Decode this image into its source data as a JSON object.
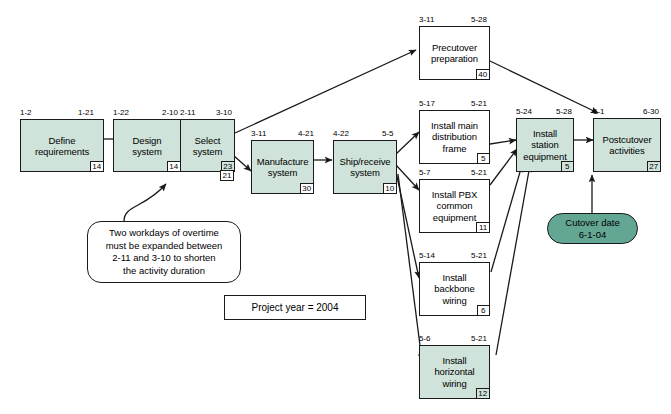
{
  "colors": {
    "critical_fill": "#cfe3da",
    "noncritical_fill": "#ffffff",
    "milestone_fill": "#63a694",
    "line": "#1a1a1a"
  },
  "legend": {
    "project_year_label": "Project year = 2004"
  },
  "note": {
    "text": "Two workdays of overtime\nmust be expanded between\n2-11 and 3-10 to shorten\nthe activity duration"
  },
  "milestone": {
    "name": "Cutover date",
    "date": "6-1-04",
    "text": "Cutover date\n6-1-04"
  },
  "nodes": [
    {
      "id": "define-requirements",
      "label": "Define\nrequirements",
      "start": "1-2",
      "finish": "1-21",
      "duration": "14",
      "critical": true
    },
    {
      "id": "design-system",
      "label": "Design\nsystem",
      "start": "1-22",
      "finish": "2-10",
      "duration": "14",
      "critical": true
    },
    {
      "id": "select-system",
      "label": "Select\nsystem",
      "start": "2-11",
      "finish": "3-10",
      "duration": "23",
      "duration_revised": "21",
      "critical": true
    },
    {
      "id": "manufacture-system",
      "label": "Manufacture\nsystem",
      "start": "3-11",
      "finish": "4-21",
      "duration": "30",
      "critical": true
    },
    {
      "id": "ship-receive-system",
      "label": "Ship/receive\nsystem",
      "start": "4-22",
      "finish": "5-5",
      "duration": "10",
      "critical": true
    },
    {
      "id": "precutover-preparation",
      "label": "Precutover\npreparation",
      "start": "3-11",
      "finish": "5-28",
      "duration": "40",
      "critical": false
    },
    {
      "id": "install-main-distribution-frame",
      "label": "Install main\ndistribution\nframe",
      "start": "5-17",
      "finish": "5-21",
      "duration": "5",
      "critical": false
    },
    {
      "id": "install-pbx-common-equipment",
      "label": "Install PBX\ncommon\nequipment",
      "start": "5-7",
      "finish": "5-21",
      "duration": "11",
      "critical": false
    },
    {
      "id": "install-backbone-wiring",
      "label": "Install\nbackbone\nwiring",
      "start": "5-14",
      "finish": "5-21",
      "duration": "6",
      "critical": false
    },
    {
      "id": "install-horizontal-wiring",
      "label": "Install\nhorizontal\nwiring",
      "start": "5-6",
      "finish": "5-21",
      "duration": "12",
      "critical": true
    },
    {
      "id": "install-station-equipment",
      "label": "Install\nstation\nequipment",
      "start": "5-24",
      "finish": "5-28",
      "duration": "5",
      "critical": true
    },
    {
      "id": "postcutover-activities",
      "label": "Postcutover\nactivities",
      "start": "6-1",
      "finish": "6-30",
      "duration": "27",
      "critical": true
    }
  ]
}
